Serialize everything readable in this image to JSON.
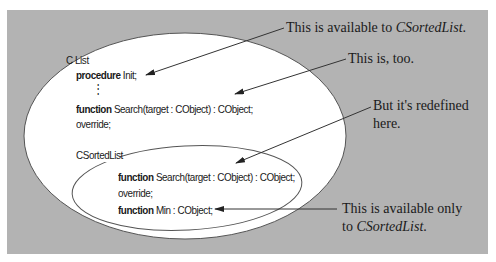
{
  "colors": {
    "background": "#ffffff",
    "panel": "#b3b3b3",
    "ellipse_fill": "#ffffff",
    "ellipse_stroke": "#555555",
    "arrow": "#333333",
    "text": "#1a1a1a"
  },
  "outer_class": {
    "name": "C List",
    "members": [
      {
        "keyword": "procedure",
        "text": " Init;"
      },
      {
        "ellipsis": "⋮"
      },
      {
        "keyword": "function",
        "text": " Search(target : CObject) : CObject;"
      },
      {
        "keyword": "",
        "text": "override;"
      }
    ]
  },
  "inner_class": {
    "name": "CSortedList",
    "members": [
      {
        "keyword": "function",
        "text": " Search(target : CObject) : CObject;"
      },
      {
        "keyword": "",
        "text": "override;"
      },
      {
        "keyword": "function",
        "text": " Min : CObject;"
      }
    ]
  },
  "annotations": [
    {
      "id": "a1",
      "prefix": "This is available to ",
      "em": "CSortedList",
      "suffix": "."
    },
    {
      "id": "a2",
      "text": "This is, too."
    },
    {
      "id": "a3",
      "line1": "But it's redefined",
      "line2": "here."
    },
    {
      "id": "a4",
      "line1": "This is available only",
      "line2_prefix": "to ",
      "line2_em": "CSortedList",
      "line2_suffix": "."
    }
  ]
}
